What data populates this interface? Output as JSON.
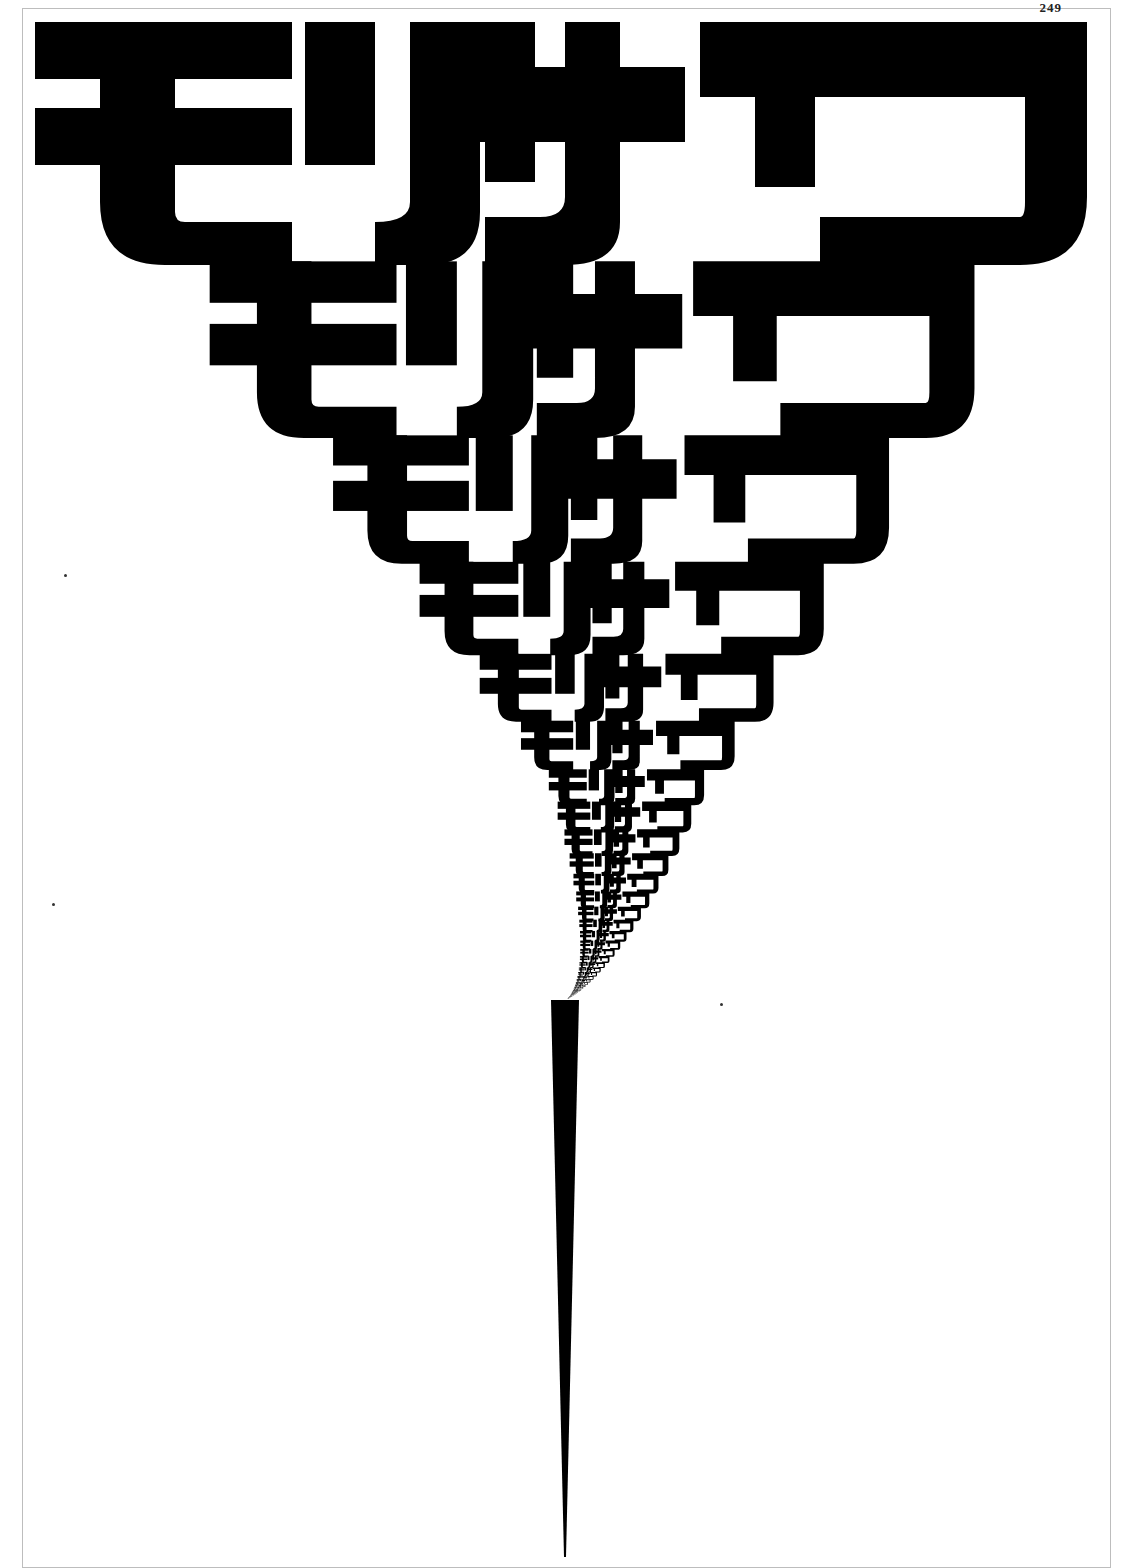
{
  "page": {
    "header_text": "249",
    "header_caption": "ꜱᴛᴀʀᴇ"
  },
  "poster": {
    "word": "モリサワ",
    "glyphs": [
      "モ",
      "リ",
      "サ",
      "ワ"
    ],
    "ink_color": "#000000",
    "paper_color": "#ffffff",
    "rows": 40,
    "scale_ratio": 0.727,
    "apex_x": 565,
    "apex_y": 1557
  }
}
